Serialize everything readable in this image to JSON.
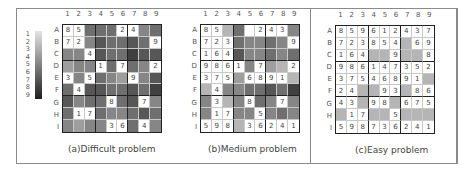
{
  "legend": {
    "labels": [
      "1",
      "2",
      "3",
      "4",
      "5",
      "6",
      "7",
      "8",
      "9"
    ],
    "gradient_start": "#e4e4e4",
    "gradient_end": "#1e1e1e"
  },
  "column_labels": [
    "1",
    "2",
    "3",
    "4",
    "5",
    "6",
    "7",
    "8",
    "9"
  ],
  "row_labels": [
    "A",
    "B",
    "C",
    "D",
    "E",
    "F",
    "G",
    "H",
    "I"
  ],
  "panels": [
    {
      "caption": "(a)Difficult problem",
      "values": [
        [
          "8",
          "5",
          "",
          "",
          "",
          "2",
          "4",
          "",
          ""
        ],
        [
          "7",
          "2",
          "",
          "",
          "",
          "",
          "",
          "",
          "9"
        ],
        [
          "",
          "",
          "4",
          "",
          "",
          "",
          "",
          "",
          ""
        ],
        [
          "",
          "",
          "",
          "1",
          "",
          "7",
          "",
          "",
          "2"
        ],
        [
          "3",
          "",
          "5",
          "",
          "",
          "",
          "9",
          "",
          ""
        ],
        [
          "",
          "4",
          "",
          "",
          "",
          "",
          "",
          "",
          ""
        ],
        [
          "",
          "",
          "",
          "",
          "8",
          "",
          "",
          "7",
          ""
        ],
        [
          "",
          "1",
          "7",
          "",
          "",
          "",
          "",
          "",
          ""
        ],
        [
          "",
          "",
          "",
          "",
          "3",
          "6",
          "",
          "4",
          ""
        ]
      ],
      "shades": [
        [
          0,
          0,
          6,
          6,
          6,
          0,
          0,
          5,
          6
        ],
        [
          0,
          0,
          5,
          7,
          6,
          6,
          7,
          6,
          0
        ],
        [
          5,
          5,
          0,
          7,
          6,
          6,
          8,
          7,
          7
        ],
        [
          4,
          5,
          5,
          0,
          6,
          0,
          6,
          5,
          0
        ],
        [
          0,
          5,
          0,
          6,
          5,
          4,
          0,
          5,
          7
        ],
        [
          6,
          0,
          7,
          7,
          6,
          6,
          7,
          6,
          8
        ],
        [
          7,
          5,
          6,
          6,
          0,
          6,
          7,
          0,
          5
        ],
        [
          6,
          0,
          0,
          6,
          5,
          5,
          6,
          7,
          6
        ],
        [
          5,
          4,
          5,
          5,
          0,
          0,
          6,
          0,
          5
        ]
      ]
    },
    {
      "caption": "(b)Medium problem",
      "values": [
        [
          "8",
          "5",
          "",
          "",
          "",
          "2",
          "4",
          "3",
          ""
        ],
        [
          "7",
          "2",
          "3",
          "",
          "",
          "",
          "",
          "",
          "9"
        ],
        [
          "1",
          "6",
          "4",
          "",
          "",
          "",
          "",
          "",
          ""
        ],
        [
          "9",
          "8",
          "6",
          "1",
          "",
          "7",
          "",
          "",
          "2"
        ],
        [
          "3",
          "7",
          "5",
          "",
          "6",
          "8",
          "9",
          "1",
          ""
        ],
        [
          "",
          "4",
          "",
          "",
          "",
          "",
          "",
          "",
          ""
        ],
        [
          "",
          "3",
          "",
          "",
          "8",
          "",
          "",
          "7",
          ""
        ],
        [
          "",
          "1",
          "7",
          "",
          "",
          "5",
          "",
          "",
          ""
        ],
        [
          "5",
          "9",
          "8",
          "",
          "3",
          "6",
          "2",
          "4",
          "1"
        ]
      ],
      "shades": [
        [
          0,
          0,
          3,
          6,
          0,
          0,
          0,
          0,
          5
        ],
        [
          0,
          0,
          0,
          6,
          5,
          5,
          6,
          5,
          0
        ],
        [
          0,
          0,
          0,
          7,
          5,
          5,
          6,
          5,
          6
        ],
        [
          0,
          0,
          0,
          0,
          5,
          0,
          4,
          3,
          0
        ],
        [
          0,
          0,
          0,
          4,
          0,
          0,
          0,
          0,
          3
        ],
        [
          3,
          0,
          5,
          5,
          6,
          6,
          7,
          6,
          8
        ],
        [
          5,
          0,
          3,
          5,
          0,
          6,
          5,
          0,
          5
        ],
        [
          5,
          0,
          0,
          5,
          5,
          0,
          5,
          6,
          5
        ],
        [
          0,
          0,
          0,
          3,
          0,
          0,
          0,
          0,
          0
        ]
      ]
    },
    {
      "caption": "(c)Easy problem",
      "values": [
        [
          "8",
          "5",
          "9",
          "6",
          "1",
          "2",
          "4",
          "3",
          "7"
        ],
        [
          "7",
          "2",
          "3",
          "8",
          "5",
          "4",
          "",
          "6",
          "9"
        ],
        [
          "1",
          "6",
          "4",
          "",
          "",
          "9",
          "",
          "",
          "8"
        ],
        [
          "9",
          "8",
          "6",
          "1",
          "4",
          "7",
          "3",
          "5",
          "2"
        ],
        [
          "3",
          "7",
          "5",
          "4",
          "6",
          "8",
          "9",
          "1",
          ""
        ],
        [
          "2",
          "4",
          "",
          "",
          "9",
          "3",
          "",
          "8",
          "6"
        ],
        [
          "4",
          "3",
          "",
          "9",
          "8",
          "",
          "6",
          "7",
          "5"
        ],
        [
          "",
          "1",
          "7",
          "",
          "",
          "5",
          "",
          "",
          ""
        ],
        [
          "5",
          "9",
          "8",
          "7",
          "3",
          "6",
          "2",
          "4",
          "1"
        ]
      ],
      "shades": [
        [
          0,
          0,
          0,
          0,
          0,
          0,
          0,
          0,
          0
        ],
        [
          0,
          0,
          0,
          0,
          0,
          0,
          3,
          0,
          0
        ],
        [
          0,
          0,
          0,
          3,
          3,
          0,
          3,
          3,
          0
        ],
        [
          0,
          0,
          0,
          0,
          0,
          0,
          0,
          0,
          0
        ],
        [
          0,
          0,
          0,
          0,
          0,
          0,
          0,
          0,
          3
        ],
        [
          0,
          0,
          3,
          3,
          0,
          0,
          3,
          0,
          0
        ],
        [
          0,
          0,
          3,
          0,
          0,
          3,
          0,
          0,
          0
        ],
        [
          3,
          0,
          0,
          3,
          3,
          0,
          3,
          3,
          3
        ],
        [
          0,
          0,
          0,
          0,
          0,
          0,
          0,
          0,
          0
        ]
      ]
    }
  ]
}
